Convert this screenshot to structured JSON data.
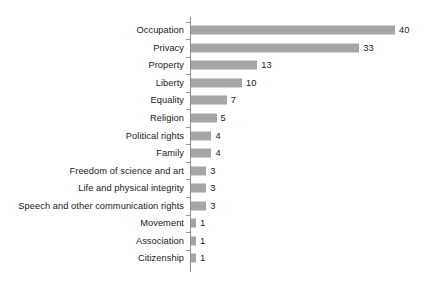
{
  "chart_data": {
    "type": "bar",
    "orientation": "horizontal",
    "title": "",
    "subtitle": "",
    "xlabel": "",
    "ylabel": "",
    "grid": false,
    "legend": false,
    "legend_position": "none",
    "xlim": [
      0,
      40
    ],
    "axis_line_color": "#8c8c8c",
    "bar_color": "#a6a6a6",
    "background_color": "#ffffff",
    "text_color": "#1a1a1a",
    "show_value_labels": true,
    "categories": [
      "Occupation",
      "Privacy",
      "Property",
      "Liberty",
      "Equality",
      "Religion",
      "Political rights",
      "Family",
      "Freedom of science and art",
      "Life and physical integrity",
      "Speech and other communication rights",
      "Movement",
      "Association",
      "Citizenship"
    ],
    "values": [
      40,
      33,
      13,
      10,
      7,
      5,
      4,
      4,
      3,
      3,
      3,
      1,
      1,
      1
    ],
    "value_labels": [
      "40",
      "33",
      "13",
      "10",
      "7",
      "5",
      "4",
      "4",
      "3",
      "3",
      "3",
      "1",
      "1",
      "1"
    ]
  }
}
